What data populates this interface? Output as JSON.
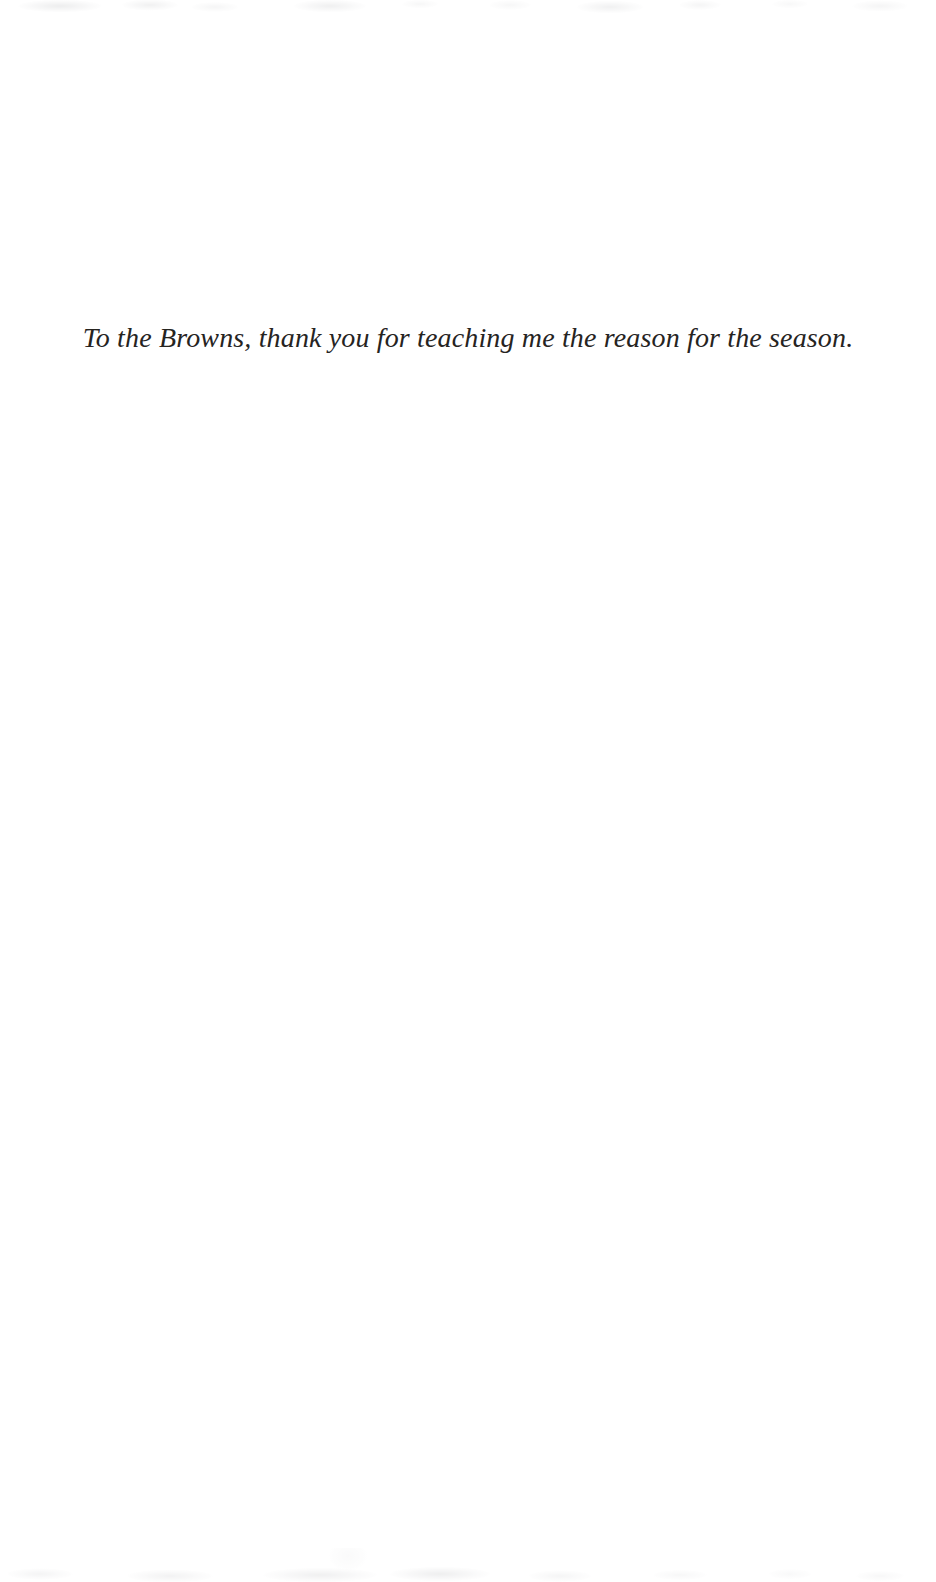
{
  "page": {
    "kind": "book-dedication-page",
    "background_color": "#ffffff",
    "ink_color": "#26241f",
    "width": 936,
    "height": 1582
  },
  "dedication": {
    "text": "To the Browns, thank you for teaching me the reason for the season."
  }
}
